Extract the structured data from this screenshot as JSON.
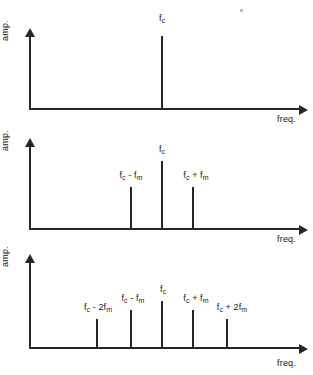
{
  "figure": {
    "axis_labels": {
      "y": "amp.",
      "x": "freq."
    }
  },
  "chart_data": [
    {
      "type": "bar",
      "title": "",
      "xlabel": "freq.",
      "ylabel": "amp.",
      "categories": [
        "f_c"
      ],
      "tick_labels": [
        "f<sub>c</sub>"
      ],
      "values": [
        1.0
      ],
      "x_positions": [
        162
      ],
      "grid": false,
      "legend": "none",
      "description": "Unmodulated carrier: single spectral line at the carrier frequency."
    },
    {
      "type": "bar",
      "title": "",
      "xlabel": "freq.",
      "ylabel": "amp.",
      "categories": [
        "f_c - f_m",
        "f_c",
        "f_c + f_m"
      ],
      "tick_labels": [
        "f<sub>c</sub> - f<sub>m</sub>",
        "f<sub>c</sub>",
        "f<sub>c</sub> + f<sub>m</sub>"
      ],
      "values": [
        0.42,
        0.72,
        0.42
      ],
      "x_positions": [
        131,
        162,
        193
      ],
      "grid": false,
      "legend": "none",
      "description": "Single-tone modulation: carrier plus first-order upper and lower sidebands."
    },
    {
      "type": "bar",
      "title": "",
      "xlabel": "freq.",
      "ylabel": "amp.",
      "categories": [
        "f_c - 2f_m",
        "f_c - f_m",
        "f_c",
        "f_c + f_m",
        "f_c + 2f_m"
      ],
      "tick_labels": [
        "f<sub>c</sub> - 2f<sub>m</sub>",
        "f<sub>c</sub> - f<sub>m</sub>",
        "f<sub>c</sub>",
        "f<sub>c</sub> + f<sub>m</sub>",
        "f<sub>c</sub> + 2f<sub>m</sub>"
      ],
      "values": [
        0.3,
        0.47,
        0.62,
        0.47,
        0.3
      ],
      "x_positions": [
        97,
        131,
        162,
        193,
        227
      ],
      "grid": false,
      "legend": "none",
      "description": "Carrier with first-order and second-order sidebands."
    }
  ]
}
